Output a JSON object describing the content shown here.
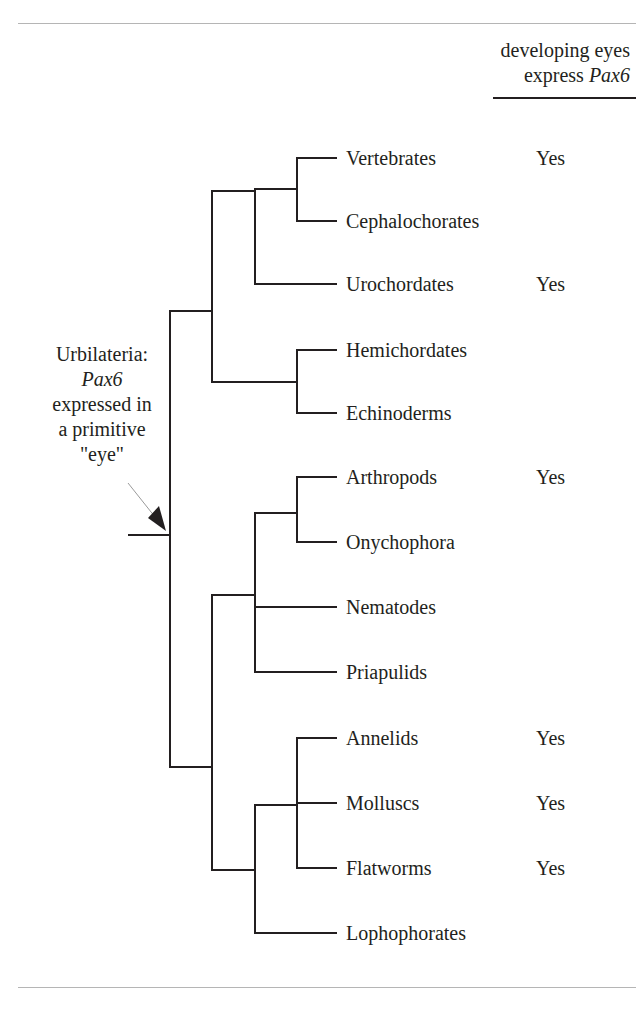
{
  "header": {
    "line1": "developing eyes",
    "line2_prefix": "express ",
    "line2_italic": "Pax6"
  },
  "annotation": {
    "line1": "Urbilateria:",
    "line2_italic": "Pax6",
    "line3": "expressed in",
    "line4": "a primitive",
    "line5": "\"eye\""
  },
  "taxa": [
    {
      "name": "Vertebrates",
      "pax6": "Yes"
    },
    {
      "name": "Cephalochorates",
      "pax6": ""
    },
    {
      "name": "Urochordates",
      "pax6": "Yes"
    },
    {
      "name": "Hemichordates",
      "pax6": ""
    },
    {
      "name": "Echinoderms",
      "pax6": ""
    },
    {
      "name": "Arthropods",
      "pax6": "Yes"
    },
    {
      "name": "Onychophora",
      "pax6": ""
    },
    {
      "name": "Nematodes",
      "pax6": ""
    },
    {
      "name": "Priapulids",
      "pax6": ""
    },
    {
      "name": "Annelids",
      "pax6": "Yes"
    },
    {
      "name": "Molluscs",
      "pax6": "Yes"
    },
    {
      "name": "Flatworms",
      "pax6": "Yes"
    },
    {
      "name": "Lophophorates",
      "pax6": ""
    }
  ],
  "colors": {
    "line": "#231f20",
    "rule": "#b5b5b5"
  }
}
